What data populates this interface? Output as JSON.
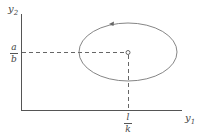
{
  "diagram": {
    "type": "phase-plane",
    "axes": {
      "y_axis_label": "y",
      "y_axis_sub": "2",
      "x_axis_label": "y",
      "x_axis_sub": "1"
    },
    "equilibrium": {
      "x_fraction": {
        "numerator": "l",
        "denominator": "k"
      },
      "y_fraction": {
        "numerator": "a",
        "denominator": "b"
      }
    },
    "orbit": {
      "shape": "ellipse",
      "direction": "counterclockwise"
    },
    "colors": {
      "line": "#555555",
      "orbit": "#777777"
    }
  }
}
